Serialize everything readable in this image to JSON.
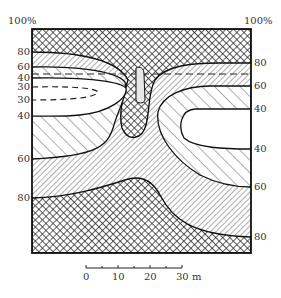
{
  "figure": {
    "type": "zonation-contour-diagram",
    "top_left_label": "100%",
    "top_right_label": "100%",
    "left_axis_labels": [
      {
        "text": "80",
        "y": 52
      },
      {
        "text": "60",
        "y": 67
      },
      {
        "text": "40",
        "y": 78
      },
      {
        "text": "30",
        "y": 87
      },
      {
        "text": "30",
        "y": 100
      },
      {
        "text": "40",
        "y": 116
      },
      {
        "text": "60",
        "y": 159
      },
      {
        "text": "80",
        "y": 198
      }
    ],
    "right_axis_labels": [
      {
        "text": "80",
        "y": 63
      },
      {
        "text": "60",
        "y": 86
      },
      {
        "text": "40",
        "y": 109
      },
      {
        "text": "40",
        "y": 149
      },
      {
        "text": "60",
        "y": 187
      },
      {
        "text": "80",
        "y": 237
      }
    ],
    "scale_bar": {
      "labels": [
        {
          "text": "0",
          "x": 86
        },
        {
          "text": "10",
          "x": 118
        },
        {
          "text": "20",
          "x": 150
        },
        {
          "text": "30 m",
          "x": 182
        }
      ]
    },
    "zones": [
      {
        "name": "80-100%",
        "pattern": "cross-hatch"
      },
      {
        "name": "60-80%",
        "pattern": "fine-diagonal-forward"
      },
      {
        "name": "40-60%",
        "pattern": "wide-diagonal-backward"
      },
      {
        "name": "<40%",
        "pattern": "blank"
      }
    ]
  }
}
